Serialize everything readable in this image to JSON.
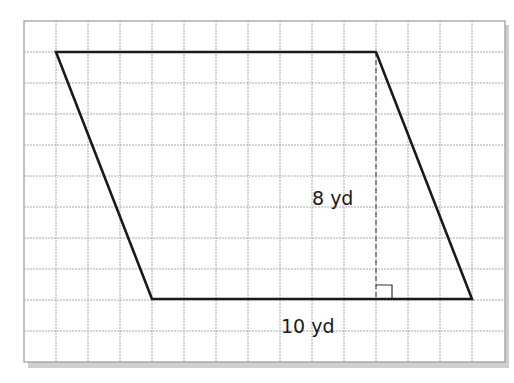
{
  "figure": {
    "type": "parallelogram-on-grid",
    "grid": {
      "columns": 15,
      "rows": 10,
      "line_color": "#a8a8a8",
      "border_color": "#9a9a9a",
      "shadow_color": "#c8c8c8"
    },
    "shape": {
      "name": "parallelogram",
      "stroke_color": "#1a1a1a",
      "vertices_grid": [
        [
          1,
          1
        ],
        [
          11,
          1
        ],
        [
          14,
          8.7
        ],
        [
          4,
          8.7
        ]
      ]
    },
    "height_line": {
      "style": "dashed",
      "right_angle_marker": true
    },
    "labels": {
      "height": "8 yd",
      "base": "10 yd"
    }
  }
}
